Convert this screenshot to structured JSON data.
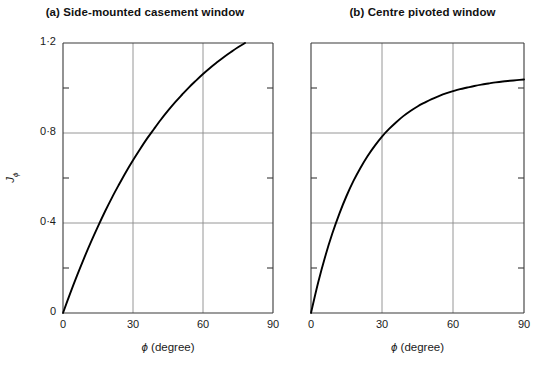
{
  "figure": {
    "background": "#ffffff",
    "curve_color": "#000000",
    "grid_color": "#8a8a8a",
    "axis_color": "#3a3a3a"
  },
  "panels": [
    {
      "id": "a",
      "title": "(a) Side-mounted casement window",
      "xlabel_symbol": "ϕ",
      "xlabel_unit": "(degree)",
      "ylabel_symbol": "J",
      "ylabel_sub": "ϕ",
      "xticks": [
        "0",
        "30",
        "60",
        "90"
      ],
      "yticks": [
        "0",
        "0·4",
        "0·8",
        "1·2"
      ]
    },
    {
      "id": "b",
      "title": "(b) Centre pivoted window",
      "xlabel_symbol": "ϕ",
      "xlabel_unit": "(degree)",
      "ylabel_symbol": "",
      "ylabel_sub": "",
      "xticks": [
        "0",
        "30",
        "60",
        "90"
      ],
      "yticks": [
        "",
        "",
        "",
        ""
      ]
    }
  ],
  "chart_data": [
    {
      "type": "line",
      "title": "(a) Side-mounted casement window",
      "xlabel": "ϕ (degree)",
      "ylabel": "Jϕ",
      "xlim": [
        0,
        90
      ],
      "ylim": [
        0,
        1.2
      ],
      "xticks": [
        0,
        30,
        60,
        90
      ],
      "yticks": [
        0,
        0.4,
        0.8,
        1.2
      ],
      "grid": true,
      "legend": "none",
      "series": [
        {
          "name": "Side-mounted casement window",
          "x": [
            0,
            3,
            6,
            9,
            12,
            15,
            18,
            21,
            24,
            27,
            30,
            33,
            36,
            39,
            42,
            45,
            48,
            51,
            54,
            57,
            60,
            63,
            66,
            69,
            72,
            75,
            78,
            81,
            84,
            87,
            90
          ],
          "y": [
            0.0,
            0.085,
            0.166,
            0.243,
            0.316,
            0.385,
            0.451,
            0.513,
            0.571,
            0.627,
            0.679,
            0.728,
            0.775,
            0.818,
            0.86,
            0.899,
            0.936,
            0.97,
            1.003,
            1.033,
            1.062,
            1.089,
            1.114,
            1.138,
            1.16,
            1.181,
            1.2,
            1.218,
            1.235,
            1.251,
            1.266
          ]
        }
      ]
    },
    {
      "type": "line",
      "title": "(b) Centre pivoted window",
      "xlabel": "ϕ (degree)",
      "ylabel": "Jϕ",
      "xlim": [
        0,
        90
      ],
      "ylim": [
        0,
        1.2
      ],
      "xticks": [
        0,
        30,
        60,
        90
      ],
      "yticks": [
        0,
        0.4,
        0.8,
        1.2
      ],
      "grid": true,
      "legend": "none",
      "series": [
        {
          "name": "Centre pivoted window",
          "x": [
            0,
            3,
            6,
            9,
            12,
            15,
            18,
            21,
            24,
            27,
            30,
            33,
            36,
            39,
            42,
            45,
            48,
            51,
            54,
            57,
            60,
            63,
            66,
            69,
            72,
            75,
            78,
            81,
            84,
            87,
            90
          ],
          "y": [
            0.0,
            0.134,
            0.251,
            0.353,
            0.442,
            0.52,
            0.588,
            0.647,
            0.699,
            0.744,
            0.784,
            0.818,
            0.848,
            0.875,
            0.898,
            0.918,
            0.935,
            0.951,
            0.964,
            0.976,
            0.986,
            0.995,
            1.002,
            1.009,
            1.015,
            1.02,
            1.025,
            1.029,
            1.032,
            1.035,
            1.038
          ]
        }
      ]
    }
  ]
}
